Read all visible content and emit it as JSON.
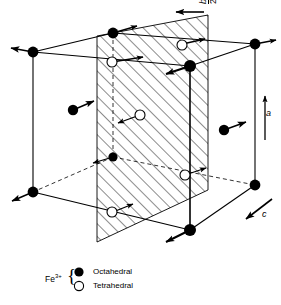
{
  "figure": {
    "type": "crystal-structure-unit-cell"
  },
  "axes": [
    {
      "name": "b-half-axis",
      "label": "b/2",
      "numerator": "b",
      "denominator": "2",
      "direction": "left",
      "arrow": "horizontal-left"
    },
    {
      "name": "a-axis",
      "label": "a",
      "direction": "up",
      "arrow": "vertical-up"
    },
    {
      "name": "c-axis",
      "label": "c",
      "direction": "down-left",
      "arrow": "diagonal-down-left"
    }
  ],
  "legend": {
    "species": "Fe",
    "charge": "3+",
    "entries": [
      {
        "marker": "filled-circle",
        "label": "Octahedral"
      },
      {
        "marker": "open-circle",
        "label": "Tetrahedral"
      }
    ]
  },
  "cell": {
    "hatch_plane_label": "hatched-diagonal-plane",
    "hatch_angle_deg": 45,
    "edge_color": "#000000",
    "hidden_edge_style": "dashed"
  },
  "sites": {
    "octahedral_count": 11,
    "tetrahedral_count": 6,
    "octahedral": [
      {
        "id": "oct-top-back-left",
        "x": 33,
        "y": 52,
        "arrow": "left"
      },
      {
        "id": "oct-top-back-mid",
        "x": 113,
        "y": 33,
        "arrow": "up-right"
      },
      {
        "id": "oct-top-right",
        "x": 255,
        "y": 44,
        "arrow": "right"
      },
      {
        "id": "oct-top-front",
        "x": 190,
        "y": 66,
        "arrow": "down-left"
      },
      {
        "id": "oct-mid-left",
        "x": 73,
        "y": 110,
        "arrow": "up-right"
      },
      {
        "id": "oct-mid-right",
        "x": 224,
        "y": 130,
        "arrow": "up-right"
      },
      {
        "id": "oct-back-left-lower",
        "x": 113,
        "y": 157,
        "arrow": "left"
      },
      {
        "id": "oct-bottom-left",
        "x": 33,
        "y": 192,
        "arrow": "down-left"
      },
      {
        "id": "oct-bottom-right",
        "x": 255,
        "y": 185,
        "arrow": "none"
      },
      {
        "id": "oct-bottom-front",
        "x": 190,
        "y": 230,
        "arrow": "down-left"
      }
    ],
    "tetrahedral": [
      {
        "id": "tet-upper-left",
        "x": 112,
        "y": 62,
        "arrow": "right"
      },
      {
        "id": "tet-upper-right",
        "x": 182,
        "y": 45,
        "arrow": "right"
      },
      {
        "id": "tet-center",
        "x": 140,
        "y": 115,
        "arrow": "left-down"
      },
      {
        "id": "tet-lower-right",
        "x": 185,
        "y": 175,
        "arrow": "left"
      },
      {
        "id": "tet-lower-left",
        "x": 112,
        "y": 212,
        "arrow": "up-right"
      }
    ]
  }
}
